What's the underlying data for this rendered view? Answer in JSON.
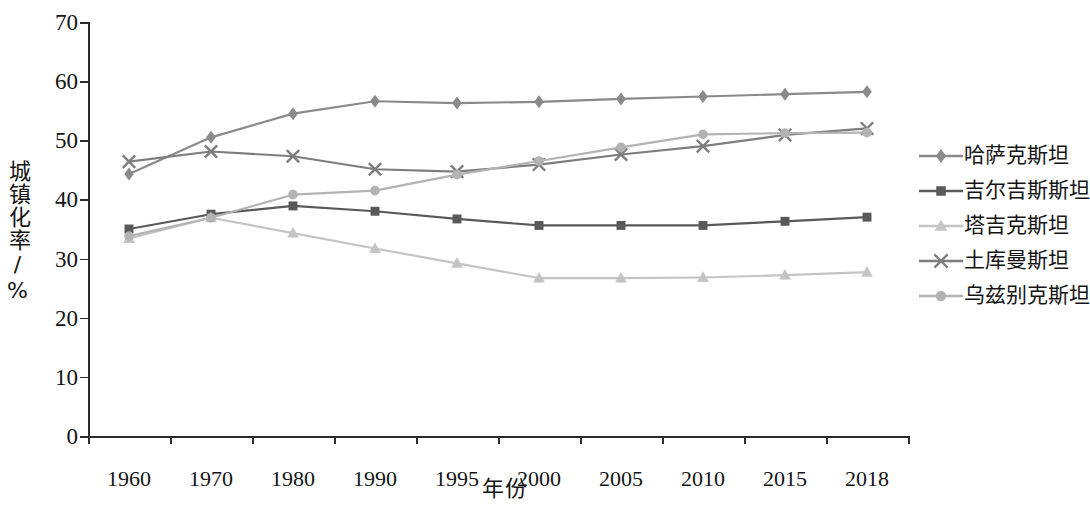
{
  "chart_data": {
    "type": "line",
    "title": "",
    "xlabel": "年份",
    "ylabel": "城镇化率/%",
    "categories": [
      "1960",
      "1970",
      "1980",
      "1990",
      "1995",
      "2000",
      "2005",
      "2010",
      "2015",
      "2018"
    ],
    "ylim": [
      0,
      70
    ],
    "yticks": [
      0,
      10,
      20,
      30,
      40,
      50,
      60,
      70
    ],
    "grid": false,
    "legend_position": "right",
    "series": [
      {
        "name": "哈萨克斯坦",
        "marker": "diamond",
        "color": "#8a8a8a",
        "values": [
          44.3,
          50.5,
          54.5,
          56.6,
          56.3,
          56.5,
          57.0,
          57.4,
          57.8,
          58.2
        ]
      },
      {
        "name": "吉尔吉斯斯坦",
        "marker": "square",
        "color": "#595959",
        "values": [
          35.0,
          37.5,
          38.9,
          38.0,
          36.7,
          35.6,
          35.6,
          35.6,
          36.3,
          37.0
        ]
      },
      {
        "name": "塔吉克斯坦",
        "marker": "triangle",
        "color": "#c4c4c4",
        "values": [
          33.4,
          36.9,
          34.3,
          31.7,
          29.2,
          26.7,
          26.7,
          26.8,
          27.2,
          27.7
        ]
      },
      {
        "name": "土库曼斯坦",
        "marker": "cross",
        "color": "#7d7d7d",
        "values": [
          46.4,
          48.1,
          47.3,
          45.1,
          44.7,
          45.9,
          47.6,
          49.0,
          50.9,
          52.0
        ]
      },
      {
        "name": "乌兹别克斯坦",
        "marker": "circle",
        "color": "#b3b3b3",
        "values": [
          33.8,
          36.9,
          40.8,
          41.5,
          44.2,
          46.5,
          48.8,
          51.0,
          51.2,
          51.3
        ]
      }
    ]
  },
  "axis": {
    "y_title": "城镇化率/%",
    "x_title": "年份",
    "y_ticks": [
      "0",
      "10",
      "20",
      "30",
      "40",
      "50",
      "60",
      "70"
    ],
    "x_ticks": [
      "1960",
      "1970",
      "1980",
      "1990",
      "1995",
      "2000",
      "2005",
      "2010",
      "2015",
      "2018"
    ]
  },
  "legend": {
    "items": [
      {
        "label": "哈萨克斯坦",
        "marker": "diamond-marker-icon"
      },
      {
        "label": "吉尔吉斯斯坦",
        "marker": "square-marker-icon"
      },
      {
        "label": "塔吉克斯坦",
        "marker": "triangle-marker-icon"
      },
      {
        "label": "土库曼斯坦",
        "marker": "cross-marker-icon"
      },
      {
        "label": "乌兹别克斯坦",
        "marker": "circle-marker-icon"
      }
    ]
  }
}
